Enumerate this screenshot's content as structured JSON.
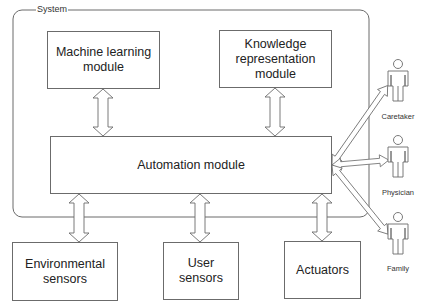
{
  "diagram": {
    "system": {
      "label": "System"
    },
    "modules": {
      "machine_learning": "Machine learning\nmodule",
      "knowledge_representation": "Knowledge\nrepresentation\nmodule",
      "automation": "Automation module"
    },
    "devices": {
      "environmental_sensors": "Environmental\nsensors",
      "user_sensors": "User\nsensors",
      "actuators": "Actuators"
    },
    "actors": [
      {
        "label": "Caretaker"
      },
      {
        "label": "Physician"
      },
      {
        "label": "Family"
      }
    ],
    "colors": {
      "stroke": "#6b6b6b",
      "text": "#222222",
      "background": "#ffffff"
    }
  }
}
